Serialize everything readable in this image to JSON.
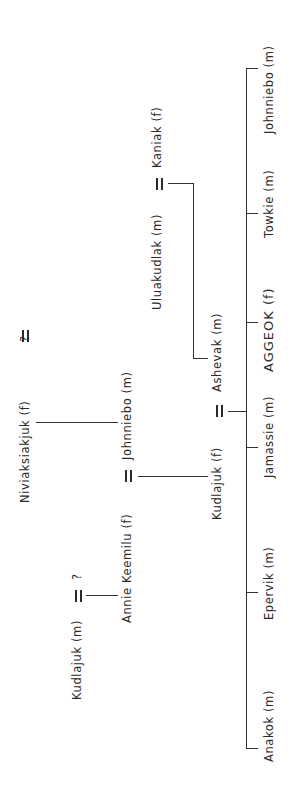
{
  "diagram": {
    "type": "genealogy",
    "orientation": "rotated -90deg",
    "people": {
      "niviaksiakjuk": "Niviaksiakjuk (f)",
      "niviaksiakjuk_spouse": "?",
      "kudlajuk_m": "Kudlajuk (m)",
      "kudlajuk_m_spouse": "?",
      "annie_keemilu": "Annie Keemilu (f)",
      "johnniebo_parent": "Johnniebo (m)",
      "uluakudlak": "Uluakudlak (m)",
      "kaniak": "Kaniak (f)",
      "kudlajuk_f": "Kudlajuk (f)",
      "ashevak": "Ashevak (m)"
    },
    "children": [
      {
        "label": "Anakok (m)"
      },
      {
        "label": "Epervik (m)"
      },
      {
        "label": "Jamassie (m)"
      },
      {
        "label": "AGGEOK (f)"
      },
      {
        "label": "Towkie (m)"
      },
      {
        "label": "Johnniebo (m)"
      }
    ],
    "marriage_symbol": "="
  }
}
